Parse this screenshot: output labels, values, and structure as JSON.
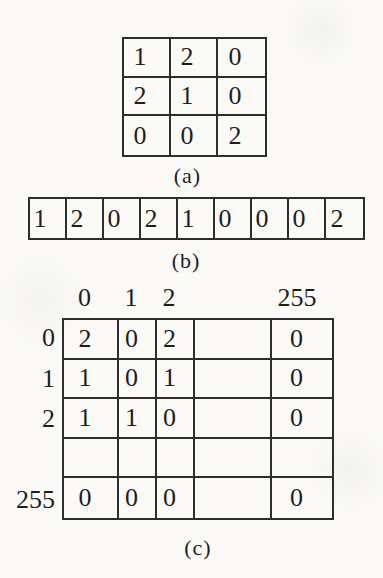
{
  "page": {
    "background": "#fbfaf7",
    "ink_color": "#1e1e1e",
    "line_color": "#2e2e2e"
  },
  "panel_a": {
    "caption": "(a)",
    "rows": [
      [
        "1",
        "2",
        "0"
      ],
      [
        "2",
        "1",
        "0"
      ],
      [
        "0",
        "0",
        "2"
      ]
    ]
  },
  "panel_b": {
    "caption": "(b)",
    "cells": [
      "1",
      "2",
      "0",
      "2",
      "1",
      "0",
      "0",
      "0",
      "2"
    ]
  },
  "panel_c": {
    "caption": "(c)",
    "col_headers": [
      "0",
      "1",
      "2",
      "255"
    ],
    "row_headers": [
      "0",
      "1",
      "2",
      "",
      "255"
    ],
    "rows": [
      [
        "2",
        "0",
        "2",
        "",
        "0"
      ],
      [
        "1",
        "0",
        "1",
        "",
        "0"
      ],
      [
        "1",
        "1",
        "0",
        "",
        "0"
      ],
      [
        "",
        "",
        "",
        "",
        ""
      ],
      [
        "0",
        "0",
        "0",
        "",
        "0"
      ]
    ]
  }
}
